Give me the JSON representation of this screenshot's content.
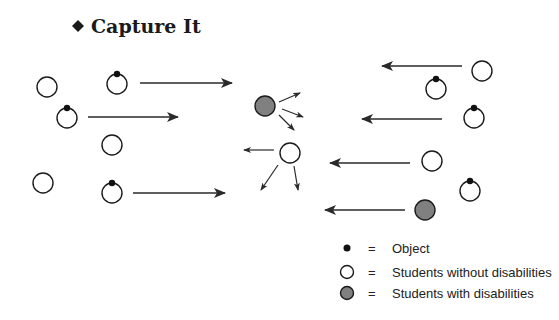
{
  "title": {
    "bullet": "diamond",
    "text": "Capture It"
  },
  "colors": {
    "stroke": "#1a1a1a",
    "student_without_fill": "#ffffff",
    "student_with_fill": "#808080",
    "object_fill": "#111111",
    "arrow": "#2a2a2a"
  },
  "students": [
    {
      "type": "without",
      "x": 47,
      "y": 87,
      "object": false
    },
    {
      "type": "without",
      "x": 117,
      "y": 84,
      "object": true
    },
    {
      "type": "without",
      "x": 67,
      "y": 118,
      "object": true
    },
    {
      "type": "without",
      "x": 112,
      "y": 145,
      "object": false
    },
    {
      "type": "without",
      "x": 43,
      "y": 183,
      "object": false
    },
    {
      "type": "without",
      "x": 112,
      "y": 193,
      "object": true
    },
    {
      "type": "with",
      "x": 265,
      "y": 106,
      "object": false
    },
    {
      "type": "without",
      "x": 290,
      "y": 153,
      "object": false
    },
    {
      "type": "without",
      "x": 482,
      "y": 71,
      "object": false
    },
    {
      "type": "without",
      "x": 436,
      "y": 89,
      "object": true
    },
    {
      "type": "without",
      "x": 474,
      "y": 118,
      "object": true
    },
    {
      "type": "without",
      "x": 432,
      "y": 161,
      "object": false
    },
    {
      "type": "without",
      "x": 470,
      "y": 191,
      "object": true
    },
    {
      "type": "with",
      "x": 425,
      "y": 210,
      "object": false
    }
  ],
  "arrows": [
    {
      "x1": 140,
      "y1": 83,
      "x2": 232,
      "y2": 83,
      "size": "large"
    },
    {
      "x1": 88,
      "y1": 117,
      "x2": 178,
      "y2": 117,
      "size": "large"
    },
    {
      "x1": 133,
      "y1": 193,
      "x2": 225,
      "y2": 193,
      "size": "large"
    },
    {
      "x1": 462,
      "y1": 66,
      "x2": 382,
      "y2": 66,
      "size": "large"
    },
    {
      "x1": 442,
      "y1": 119,
      "x2": 362,
      "y2": 119,
      "size": "large"
    },
    {
      "x1": 410,
      "y1": 163,
      "x2": 330,
      "y2": 163,
      "size": "large"
    },
    {
      "x1": 405,
      "y1": 210,
      "x2": 325,
      "y2": 210,
      "size": "large"
    },
    {
      "x1": 279,
      "y1": 102,
      "x2": 300,
      "y2": 93,
      "size": "small"
    },
    {
      "x1": 282,
      "y1": 109,
      "x2": 303,
      "y2": 117,
      "size": "small"
    },
    {
      "x1": 279,
      "y1": 115,
      "x2": 294,
      "y2": 130,
      "size": "small"
    },
    {
      "x1": 274,
      "y1": 150,
      "x2": 244,
      "y2": 150,
      "size": "small"
    },
    {
      "x1": 278,
      "y1": 165,
      "x2": 261,
      "y2": 190,
      "size": "small"
    },
    {
      "x1": 294,
      "y1": 166,
      "x2": 298,
      "y2": 190,
      "size": "small"
    }
  ],
  "legend": {
    "equals": "=",
    "items": [
      {
        "symbol": "object-dot",
        "label": "Object"
      },
      {
        "symbol": "white-circle",
        "label": "Students without disabilities"
      },
      {
        "symbol": "gray-circle",
        "label": "Students with disabilities"
      }
    ]
  }
}
